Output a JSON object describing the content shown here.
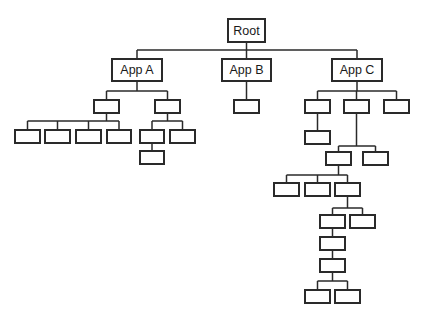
{
  "diagram": {
    "type": "tree",
    "colors": {
      "stroke": "#2a2a2a",
      "fill": "#ffffff",
      "text": "#1a1a1a",
      "background": "#ffffff"
    },
    "root": {
      "label": "Root"
    },
    "apps": [
      {
        "label": "App A"
      },
      {
        "label": "App B"
      },
      {
        "label": "App C"
      }
    ]
  }
}
